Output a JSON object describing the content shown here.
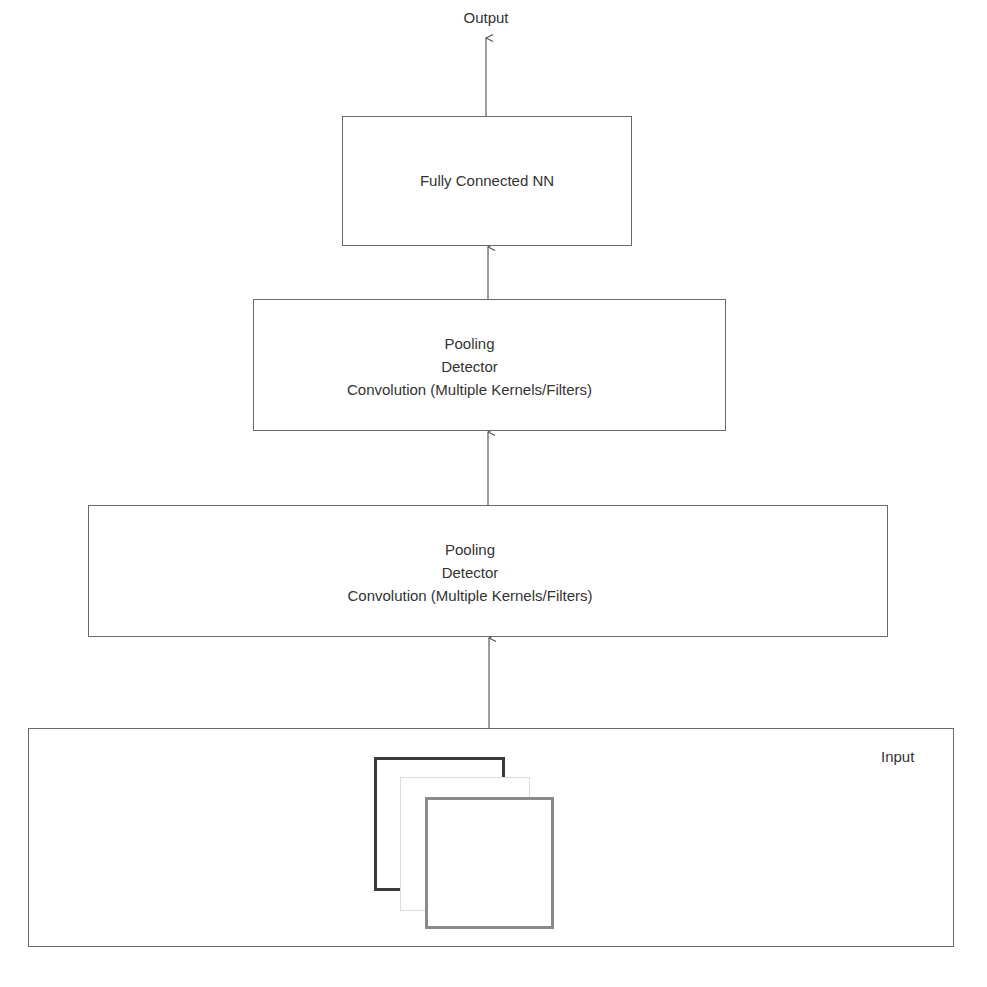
{
  "diagram": {
    "output_label": "Output",
    "fully_connected": {
      "label": "Fully Connected NN"
    },
    "conv_layer_2": {
      "lines": [
        "Pooling",
        "Detector",
        "Convolution (Multiple Kernels/Filters)"
      ]
    },
    "conv_layer_1": {
      "lines": [
        "Pooling",
        "Detector",
        "Convolution (Multiple Kernels/Filters)"
      ]
    },
    "input": {
      "label": "Input",
      "channels": [
        {
          "name": "channel-1",
          "border_color": "#3a3a3a"
        },
        {
          "name": "channel-2",
          "border_color": "#dcdcdc"
        },
        {
          "name": "channel-3",
          "border_color": "#8a8a8a"
        }
      ]
    },
    "colors": {
      "line": "#5a5a5a",
      "box_border": "#6a6a6a",
      "text": "#333333"
    }
  }
}
